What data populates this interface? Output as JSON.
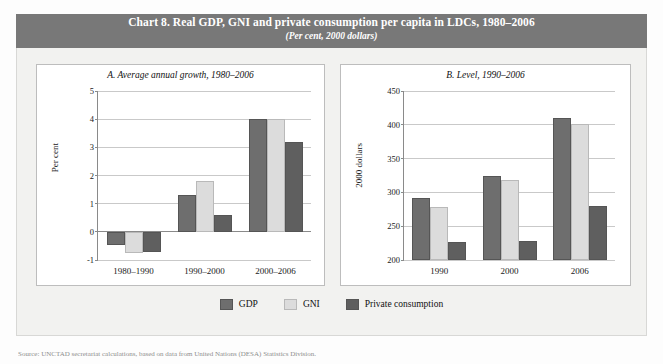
{
  "header": {
    "title": "Chart 8. Real GDP, GNI and private consumption per capita in LDCs, 1980–2006",
    "subtitle": "(Per cent, 2000 dollars)"
  },
  "legend": {
    "items": [
      {
        "label": "GDP",
        "color": "#6e6e6e"
      },
      {
        "label": "GNI",
        "color": "#dcdcdc"
      },
      {
        "label": "Private consumption",
        "color": "#5f5f5f"
      }
    ]
  },
  "source": {
    "text": "Source:  UNCTAD secretariat calculations, based on data from United Nations (DESA) Statistics Division."
  },
  "colors": {
    "header_band": "#787878",
    "panel_bg": "#ffffff",
    "box_bg": "#f2f2f0",
    "gdp": "#6e6e6e",
    "gni": "#dcdcdc",
    "private_consumption": "#5f5f5f",
    "gridline": "#c9c9c9",
    "axis": "#8a8a8a"
  },
  "chart_data": [
    {
      "id": "panel_a",
      "type": "bar",
      "title": "A.  Average annual growth, 1980–2006",
      "xlabel": "",
      "ylabel": "Per cent",
      "ylim": [
        -1,
        5
      ],
      "yticks": [
        -1,
        0,
        1,
        2,
        3,
        4,
        5
      ],
      "ytick_labels": [
        "-1",
        "0",
        "1",
        "2",
        "3",
        "4",
        "5"
      ],
      "grid": true,
      "legend_position": "bottom-center",
      "categories": [
        "1980–1990",
        "1990–2000",
        "2000–2006"
      ],
      "series": [
        {
          "name": "GDP",
          "color": "#6e6e6e",
          "values": [
            -0.45,
            1.3,
            4.0
          ]
        },
        {
          "name": "GNI",
          "color": "#dcdcdc",
          "values": [
            -0.75,
            1.8,
            4.0
          ]
        },
        {
          "name": "Private consumption",
          "color": "#5f5f5f",
          "values": [
            -0.7,
            0.6,
            3.2
          ]
        }
      ]
    },
    {
      "id": "panel_b",
      "type": "bar",
      "title": "B.  Level, 1990–2006",
      "xlabel": "",
      "ylabel": "2000 dollars",
      "ylim": [
        200,
        450
      ],
      "yticks": [
        200,
        250,
        300,
        350,
        400,
        450
      ],
      "ytick_labels": [
        "200",
        "250",
        "300",
        "350",
        "400",
        "450"
      ],
      "grid": true,
      "legend_position": "bottom-center",
      "categories": [
        "1990",
        "2000",
        "2006"
      ],
      "series": [
        {
          "name": "GDP",
          "color": "#6e6e6e",
          "values": [
            291,
            324,
            410
          ]
        },
        {
          "name": "GNI",
          "color": "#dcdcdc",
          "values": [
            278,
            319,
            401
          ]
        },
        {
          "name": "Private consumption",
          "color": "#5f5f5f",
          "values": [
            227,
            228,
            280
          ]
        }
      ]
    }
  ]
}
